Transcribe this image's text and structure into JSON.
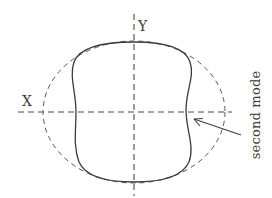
{
  "figure": {
    "type": "deformation mode diagram",
    "axes": {
      "x_label": "X",
      "y_label": "Y"
    },
    "annotation": {
      "text": "second mode",
      "points_to": "deformed cross-section (solid curve)"
    },
    "shapes": {
      "undeformed": "dashed ellipse (reference shape)",
      "deformed": "solid peanut-shaped curve (second mode shape)"
    },
    "colors": {
      "line": "#4a4a4a",
      "background": "#ffffff"
    }
  }
}
